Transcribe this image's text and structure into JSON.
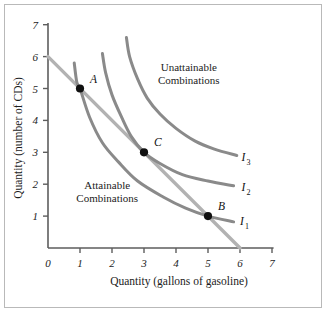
{
  "chart_data": {
    "type": "line",
    "title": "",
    "xlabel": "Quantity (gallons of gasoline)",
    "ylabel": "Quantity (number of CDs)",
    "xlim": [
      0,
      7
    ],
    "ylim": [
      0,
      7
    ],
    "xticks": [
      "0",
      "1",
      "2",
      "3",
      "4",
      "5",
      "6",
      "7"
    ],
    "yticks": [
      "1",
      "2",
      "3",
      "4",
      "5",
      "6",
      "7"
    ],
    "grid": false,
    "legend_position": "inline-right-of-curves",
    "series": [
      {
        "name": "Budget line",
        "type": "line",
        "color": "#b2b2b2",
        "points": [
          [
            0,
            6
          ],
          [
            6,
            0
          ]
        ]
      },
      {
        "name": "I1",
        "type": "indifference-curve",
        "color": "#8a8a8a",
        "points": [
          [
            0.82,
            5.8
          ],
          [
            0.9,
            5.2
          ],
          [
            1.0,
            5.0
          ],
          [
            1.3,
            4.1
          ],
          [
            1.7,
            3.3
          ],
          [
            2.2,
            2.7
          ],
          [
            2.8,
            2.1
          ],
          [
            3.6,
            1.6
          ],
          [
            4.3,
            1.25
          ],
          [
            5.0,
            1.0
          ],
          [
            5.8,
            0.82
          ]
        ]
      },
      {
        "name": "I2",
        "type": "indifference-curve",
        "color": "#8a8a8a",
        "points": [
          [
            1.7,
            6.1
          ],
          [
            1.8,
            5.5
          ],
          [
            2.0,
            4.8
          ],
          [
            2.3,
            4.1
          ],
          [
            2.6,
            3.5
          ],
          [
            3.0,
            3.0
          ],
          [
            3.5,
            2.65
          ],
          [
            4.2,
            2.3
          ],
          [
            5.0,
            2.1
          ],
          [
            5.8,
            1.95
          ]
        ]
      },
      {
        "name": "I3",
        "type": "indifference-curve",
        "color": "#8a8a8a",
        "points": [
          [
            2.45,
            6.6
          ],
          [
            2.55,
            6.0
          ],
          [
            2.8,
            5.3
          ],
          [
            3.1,
            4.7
          ],
          [
            3.5,
            4.2
          ],
          [
            4.0,
            3.75
          ],
          [
            4.6,
            3.35
          ],
          [
            5.2,
            3.1
          ],
          [
            5.9,
            2.9
          ]
        ]
      }
    ],
    "points": [
      {
        "label": "A",
        "x": 1,
        "y": 5
      },
      {
        "label": "C",
        "x": 3,
        "y": 3
      },
      {
        "label": "B",
        "x": 5,
        "y": 1
      }
    ],
    "curve_labels": [
      {
        "base": "I",
        "sub": "3",
        "x": 6.05,
        "y": 2.72
      },
      {
        "base": "I",
        "sub": "2",
        "x": 6.05,
        "y": 1.78
      },
      {
        "base": "I",
        "sub": "1",
        "x": 6.0,
        "y": 0.72
      }
    ],
    "annotations": [
      {
        "name": "unattainable",
        "line1": "Unattainable",
        "line2": "Combinations",
        "x": 4.4,
        "y": 5.55
      },
      {
        "name": "attainable",
        "line1": "Attainable",
        "line2": "Combinations",
        "x": 1.85,
        "y": 1.85
      }
    ],
    "colors": {
      "curve": "#8a8a8a",
      "budget_line": "#b2b2b2",
      "axis": "#5d5d5d",
      "point": "#101010",
      "border": "#b9b9b9",
      "background": "#ffffff"
    }
  }
}
